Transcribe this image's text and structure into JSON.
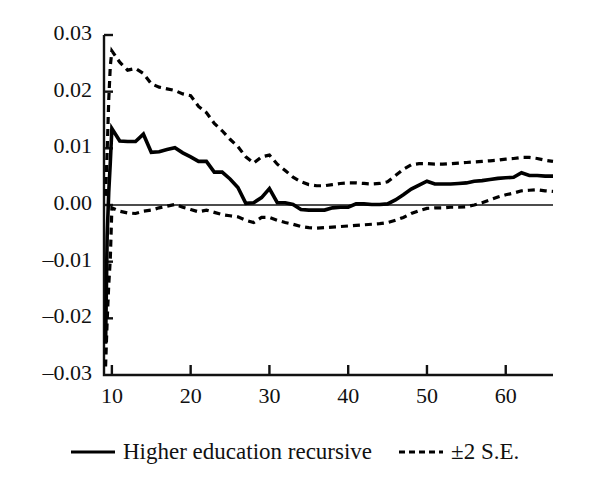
{
  "chart_data": {
    "type": "line",
    "title": "",
    "subtitle": "",
    "xlabel": "",
    "ylabel": "",
    "xlim": [
      9,
      66
    ],
    "ylim": [
      -0.03,
      0.03
    ],
    "grid": false,
    "legend_position": "bottom",
    "x_ticks": [
      10,
      20,
      30,
      40,
      50,
      60
    ],
    "x_tick_labels": [
      "10",
      "20",
      "30",
      "40",
      "50",
      "60"
    ],
    "y_ticks": [
      0.03,
      0.02,
      0.01,
      0.0,
      -0.01,
      -0.02,
      -0.03
    ],
    "y_tick_labels": [
      "0.03",
      "0.02",
      "0.01",
      "0.00",
      "–0.01",
      "–0.02",
      "–0.03"
    ],
    "zero_line": 0.0,
    "x": [
      9.2,
      9.4,
      9.6,
      9.8,
      10,
      11,
      12,
      13,
      14,
      15,
      16,
      17,
      18,
      19,
      20,
      21,
      22,
      23,
      24,
      25,
      26,
      27,
      28,
      29,
      30,
      31,
      32,
      33,
      34,
      35,
      36,
      37,
      38,
      39,
      40,
      41,
      42,
      43,
      44,
      45,
      46,
      47,
      48,
      49,
      50,
      51,
      52,
      53,
      54,
      55,
      56,
      57,
      58,
      59,
      60,
      61,
      62,
      63,
      64,
      65,
      66
    ],
    "series": [
      {
        "name": "Higher education recursive",
        "style": "solid",
        "color": "#000000",
        "values": [
          -0.0245,
          -0.0055,
          0.0022,
          0.0075,
          0.0135,
          0.0113,
          0.0112,
          0.0112,
          0.0125,
          0.0093,
          0.0094,
          0.0098,
          0.0101,
          0.0092,
          0.0085,
          0.0077,
          0.0077,
          0.0058,
          0.0058,
          0.0046,
          0.0031,
          0.0003,
          0.0004,
          0.0013,
          0.0029,
          0.0004,
          0.0004,
          0.0001,
          -0.0008,
          -0.0009,
          -0.0009,
          -0.0009,
          -0.0005,
          -0.0004,
          -0.0004,
          0.0002,
          0.0002,
          0.0001,
          0.0001,
          0.0002,
          0.0009,
          0.0018,
          0.0028,
          0.0035,
          0.0042,
          0.0037,
          0.0037,
          0.0037,
          0.0038,
          0.0039,
          0.0042,
          0.0043,
          0.0045,
          0.0047,
          0.0048,
          0.0049,
          0.0057,
          0.0052,
          0.0052,
          0.0051,
          0.0051
        ]
      },
      {
        "name": "+2 S.E.",
        "style": "dashed",
        "color": "#000000",
        "values": [
          0.0016,
          0.0095,
          0.0185,
          0.0245,
          0.0272,
          0.0252,
          0.0238,
          0.0241,
          0.0232,
          0.0214,
          0.0208,
          0.0205,
          0.0202,
          0.0196,
          0.0193,
          0.0174,
          0.0163,
          0.0144,
          0.0131,
          0.0116,
          0.0103,
          0.0085,
          0.0074,
          0.0085,
          0.0088,
          0.0072,
          0.0061,
          0.0049,
          0.0041,
          0.0036,
          0.0034,
          0.0034,
          0.0036,
          0.0038,
          0.0039,
          0.0039,
          0.0038,
          0.0037,
          0.0038,
          0.0041,
          0.0052,
          0.0063,
          0.0071,
          0.0073,
          0.0073,
          0.0072,
          0.0072,
          0.0073,
          0.0074,
          0.0075,
          0.0076,
          0.0077,
          0.0078,
          0.0079,
          0.0081,
          0.0082,
          0.0084,
          0.0084,
          0.0082,
          0.0079,
          0.0077
        ]
      },
      {
        "name": "-2 S.E.",
        "style": "dashed",
        "color": "#000000",
        "values": [
          -0.0285,
          -0.0205,
          -0.0141,
          -0.0095,
          -0.0005,
          -0.0011,
          -0.0014,
          -0.0015,
          -0.0011,
          -0.0009,
          -0.0005,
          -0.0002,
          0.0001,
          -0.0004,
          -0.0008,
          -0.0012,
          -0.0009,
          -0.0013,
          -0.0017,
          -0.0019,
          -0.0021,
          -0.0027,
          -0.0031,
          -0.0022,
          -0.0022,
          -0.0027,
          -0.0031,
          -0.0034,
          -0.0038,
          -0.004,
          -0.0041,
          -0.004,
          -0.0039,
          -0.0038,
          -0.0037,
          -0.0036,
          -0.0035,
          -0.0034,
          -0.0033,
          -0.0031,
          -0.0027,
          -0.0022,
          -0.0015,
          -0.001,
          -0.0006,
          -0.0005,
          -0.0005,
          -0.0004,
          -0.0004,
          -0.0003,
          0.0,
          0.0004,
          0.0009,
          0.0014,
          0.0018,
          0.0021,
          0.0025,
          0.0026,
          0.0027,
          0.0025,
          0.0024
        ]
      }
    ]
  },
  "legend": {
    "entries": [
      {
        "label": "Higher education recursive",
        "style": "solid"
      },
      {
        "label": "±2 S.E.",
        "style": "dashed"
      }
    ]
  }
}
